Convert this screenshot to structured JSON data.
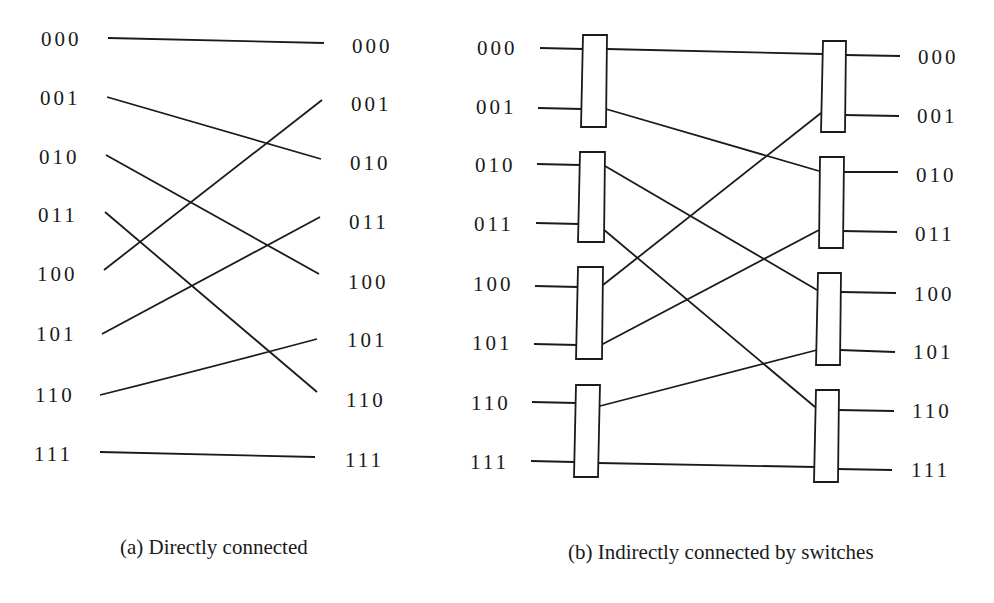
{
  "figure": {
    "panel_a": {
      "caption": "(a) Directly connected",
      "left_labels": [
        "000",
        "001",
        "010",
        "011",
        "100",
        "101",
        "110",
        "111"
      ],
      "right_labels": [
        "000",
        "001",
        "010",
        "011",
        "100",
        "101",
        "110",
        "111"
      ],
      "connections": [
        {
          "from": "000",
          "to": "000"
        },
        {
          "from": "001",
          "to": "010"
        },
        {
          "from": "010",
          "to": "100"
        },
        {
          "from": "011",
          "to": "110"
        },
        {
          "from": "100",
          "to": "001"
        },
        {
          "from": "101",
          "to": "011"
        },
        {
          "from": "110",
          "to": "101"
        },
        {
          "from": "111",
          "to": "111"
        }
      ]
    },
    "panel_b": {
      "caption": "(b) Indirectly connected by switches",
      "left_labels": [
        "000",
        "001",
        "010",
        "011",
        "100",
        "101",
        "110",
        "111"
      ],
      "right_labels": [
        "000",
        "001",
        "010",
        "011",
        "100",
        "101",
        "110",
        "111"
      ],
      "switch_columns": 2,
      "switches_per_column": 4,
      "connections": [
        {
          "from": "000",
          "to": "000"
        },
        {
          "from": "001",
          "to": "010"
        },
        {
          "from": "010",
          "to": "100"
        },
        {
          "from": "011",
          "to": "110"
        },
        {
          "from": "100",
          "to": "001"
        },
        {
          "from": "101",
          "to": "011"
        },
        {
          "from": "110",
          "to": "101"
        },
        {
          "from": "111",
          "to": "111"
        }
      ]
    },
    "colors": {
      "ink": "#1a1a1a",
      "background": "#ffffff"
    }
  }
}
